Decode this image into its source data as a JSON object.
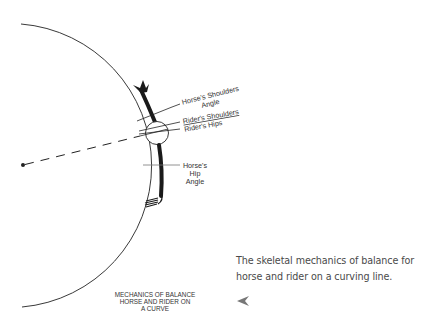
{
  "diagram": {
    "labels": {
      "horse_shoulders": [
        "Horse's Shoulders",
        "Angle"
      ],
      "rider_shoulders": "Rider's Shoulders",
      "rider_hips": "Rider's Hips",
      "horse_hip": [
        "Horse's",
        "Hip",
        "Angle"
      ]
    },
    "title_lines": [
      "MECHANICS OF BALANCE",
      "HORSE AND RIDER ON",
      "A CURVE"
    ],
    "colors": {
      "line": "#222222",
      "text": "#333333",
      "caption": "#4a4a4a",
      "arrow": "#777777"
    }
  },
  "caption": {
    "line1": "The skeletal mechanics of balance for",
    "line2": "horse and rider on a curving line."
  },
  "arrow_icon": "left-arrowhead-icon"
}
